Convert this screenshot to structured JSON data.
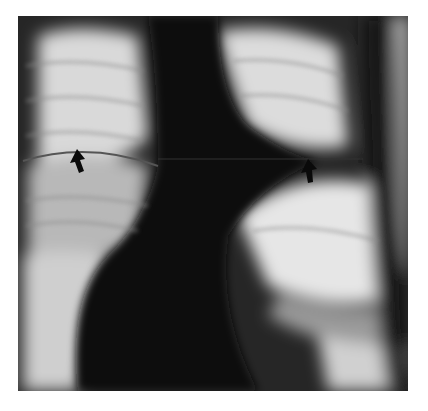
{
  "figure": {
    "type": "chest radiograph",
    "alt": "Frontal chest radiograph with two black arrows marking a horizontal line across both lung fields",
    "annotations": [
      {
        "name": "arrow-right-hemithorax",
        "x": 77,
        "y": 157,
        "direction": "up"
      },
      {
        "name": "arrow-left-hemithorax",
        "x": 308,
        "y": 167,
        "direction": "up"
      }
    ],
    "colors": {
      "background": "#ffffff",
      "dense": "#141414",
      "lucent": "#e6e6e6",
      "arrow": "#0a0a0a"
    }
  }
}
